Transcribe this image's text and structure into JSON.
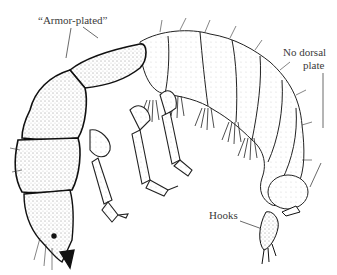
{
  "figure": {
    "labels": {
      "armor": "“Armor-plated”",
      "no_dorsal_line1": "No dorsal",
      "no_dorsal_line2": "plate",
      "hooks": "Hooks"
    }
  }
}
